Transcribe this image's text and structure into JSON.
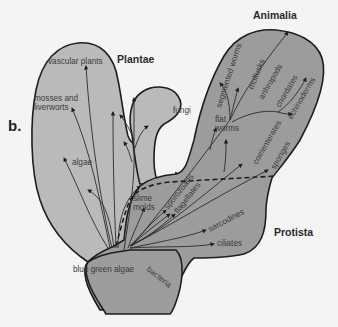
{
  "panel_label": "b.",
  "colors": {
    "background": "#f4f4f4",
    "plantae_fill": "#bababa",
    "animalia_protista_fill": "#9c9c9c",
    "outline": "#1e1e1e"
  },
  "kingdoms": {
    "plantae": "Plantae",
    "animalia": "Animalia",
    "protista": "Protista"
  },
  "groups": {
    "vascular_plants": "vascular plants",
    "mosses": "mosses and",
    "liverworts": "liverworts",
    "algae": "algae",
    "fungi": "fungi",
    "slime": "slime",
    "molds": "molds",
    "sporozoans": "sporozoans",
    "flagellates": "flagellates",
    "sarcodines": "sarcodines",
    "ciliates": "ciliates",
    "blue_green_algae": "blue green algae",
    "bacteria": "bacteria",
    "segmented_worms": "segmented worms",
    "mollusks": "mollusks",
    "arthropods": "arthropods",
    "chordates": "chordates",
    "echinoderms": "echinoderms",
    "flat": "flat",
    "worms": "worms",
    "coelenterates": "coelenterates",
    "sponges": "sponges"
  }
}
